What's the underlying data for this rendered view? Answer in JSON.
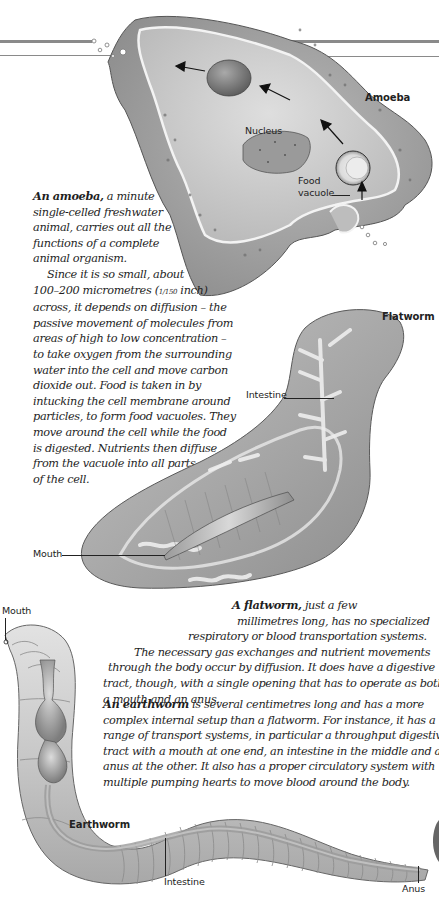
{
  "header_rules": {
    "color": "#8a8a8a"
  },
  "amoeba": {
    "title": "Amoeba",
    "labels": {
      "nucleus": "Nucleus",
      "food_vacuole_line1": "Food",
      "food_vacuole_line2": "vacuole"
    },
    "text": {
      "lead": "An amoeba,",
      "lines": [
        " a minute",
        "single-celled freshwater",
        "animal, carries out all the",
        "functions of a complete",
        "animal organism.",
        "Since it is so small, about",
        "100–200 micrometres (",
        "across, it depends on diffusion – the",
        "passive movement of molecules from",
        "areas of high to low concentration –",
        "to take oxygen from the surrounding",
        "water into the cell and move carbon",
        "dioxide out. Food is taken in by",
        "intucking the cell membrane around",
        "particles, to form food vacuoles. They",
        "move around the cell while the food",
        "is digested. Nutrients then diffuse",
        "from the vacuole into all parts",
        "of the cell."
      ],
      "fraction": "1/150",
      "inch_suffix": " inch)"
    }
  },
  "flatworm": {
    "title": "Flatworm",
    "labels": {
      "intestine": "Intestine",
      "mouth": "Mouth"
    },
    "text": {
      "lead": "A flatworm,",
      "lines": [
        " just a few",
        "millimetres long, has no specialized",
        "respiratory or blood transportation systems.",
        "The necessary gas exchanges and nutrient movements",
        "through the body occur by diffusion. It does have a digestive",
        "tract, though, with a single opening that has to operate as both",
        "a mouth and an anus."
      ]
    }
  },
  "earthworm": {
    "title": "Earthworm",
    "labels": {
      "mouth": "Mouth",
      "intestine": "Intestine",
      "anus": "Anus"
    },
    "text": {
      "lead": "An earthworm",
      "lines": [
        " is several centimetres long and has a more",
        "complex internal setup than a flatworm. For instance, it has a",
        "range of transport systems, in particular a throughput digestive",
        "tract with a mouth at one end, an intestine in the middle and an",
        "anus at the other. It also has a proper circulatory system with",
        "multiple pumping hearts to move blood around the body."
      ]
    }
  },
  "colors": {
    "ink": "#1f1f1f",
    "cell_body": "#a8a8a8",
    "cell_inner": "#c9c9c9",
    "membrane": "#f2f2f2",
    "worm_light": "#d6d6d6",
    "worm_dark": "#8f8f8f"
  }
}
